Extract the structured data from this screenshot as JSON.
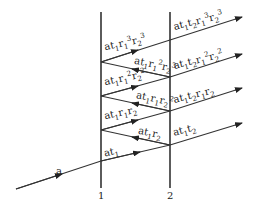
{
  "diagram": {
    "type": "multiple-reflection",
    "surfaces": [
      {
        "id": "1",
        "label": "1"
      },
      {
        "id": "2",
        "label": "2"
      }
    ],
    "incident": {
      "label": "a"
    },
    "labels_between": [
      {
        "text": "at1r1³r2³",
        "html": "at<sub>1</sub>r<sub>1</sub><sup>3</sup>r<sub>2</sub><sup>3</sup>"
      },
      {
        "text": "at1r1²r2³",
        "html": "at<sub>1</sub>r<sub>1</sub><sup>2</sup>r<sub>2</sub><sup>3</sup>"
      },
      {
        "text": "at1r1²r2²",
        "html": "at<sub>1</sub>r<sub>1</sub><sup>2</sup>r<sub>2</sub><sup>2</sup>"
      },
      {
        "text": "at1r1r2²",
        "html": "at<sub>1</sub>r<sub>1</sub>r<sub>2</sub><sup>2</sup>"
      },
      {
        "text": "at1r1r2",
        "html": "at<sub>1</sub>r<sub>1</sub>r<sub>2</sub>"
      },
      {
        "text": "at1r2",
        "html": "at<sub>1</sub>r<sub>2</sub>"
      },
      {
        "text": "at1",
        "html": "at<sub>1</sub>"
      }
    ],
    "labels_transmitted": [
      {
        "text": "at1t2r1³r2³",
        "html": "at<sub>1</sub>t<sub>2</sub>r<sub>1</sub><sup>3</sup>r<sub>2</sub><sup>3</sup>"
      },
      {
        "text": "at1t2r1²r2²",
        "html": "at<sub>1</sub>t<sub>2</sub>r<sub>1</sub><sup>2</sup>r<sub>2</sub><sup>2</sup>"
      },
      {
        "text": "at1t2r1r2",
        "html": "at<sub>1</sub>t<sub>2</sub>r<sub>1</sub>r<sub>2</sub>"
      },
      {
        "text": "at1t2",
        "html": "at<sub>1</sub>t<sub>2</sub>"
      }
    ]
  }
}
